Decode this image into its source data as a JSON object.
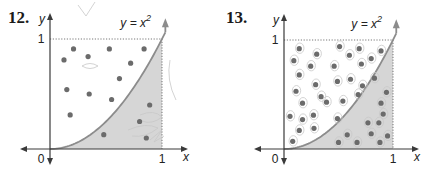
{
  "chart_data": [
    {
      "type": "scatter",
      "problem_number": "12.",
      "curve_label": "y = x",
      "curve_exponent": "2",
      "curve": "y = x^2",
      "xlabel": "x",
      "ylabel": "y",
      "x_ticks": [
        "0",
        "1"
      ],
      "y_ticks": [
        "1"
      ],
      "xlim": [
        0,
        1
      ],
      "ylim": [
        0,
        1
      ],
      "shaded_region": "area under y = x^2 from x = 0 to x = 1",
      "points": [
        [
          0.21,
          0.91
        ],
        [
          0.53,
          0.91
        ],
        [
          0.84,
          0.91
        ],
        [
          0.125,
          0.81
        ],
        [
          0.34,
          0.84
        ],
        [
          0.72,
          0.78
        ],
        [
          0.62,
          0.64
        ],
        [
          0.15,
          0.54
        ],
        [
          0.35,
          0.5
        ],
        [
          0.55,
          0.45
        ],
        [
          0.18,
          0.31
        ],
        [
          0.89,
          0.4
        ],
        [
          0.8,
          0.25
        ],
        [
          0.48,
          0.13
        ],
        [
          0.86,
          0.1
        ]
      ],
      "total_points": 15,
      "points_under_curve": 4
    },
    {
      "type": "scatter",
      "problem_number": "13.",
      "curve_label": "y = x",
      "curve_exponent": "2",
      "curve": "y = x^2",
      "xlabel": "x",
      "ylabel": "y",
      "x_ticks": [
        "0",
        "1"
      ],
      "y_ticks": [
        "1"
      ],
      "xlim": [
        0,
        1
      ],
      "ylim": [
        0,
        1
      ],
      "shaded_region": "area under y = x^2 from x = 0 to x = 1",
      "points": [
        [
          0.14,
          0.92
        ],
        [
          0.3,
          0.87
        ],
        [
          0.09,
          0.81
        ],
        [
          0.245,
          0.76
        ],
        [
          0.14,
          0.68
        ],
        [
          0.29,
          0.59
        ],
        [
          0.11,
          0.53
        ],
        [
          0.34,
          0.48
        ],
        [
          0.39,
          0.43
        ],
        [
          0.17,
          0.42
        ],
        [
          0.27,
          0.31
        ],
        [
          0.055,
          0.3
        ],
        [
          0.17,
          0.27
        ],
        [
          0.14,
          0.17
        ],
        [
          0.275,
          0.19
        ],
        [
          0.08,
          0.07
        ],
        [
          0.51,
          0.94
        ],
        [
          0.69,
          0.92
        ],
        [
          0.89,
          0.9
        ],
        [
          0.6,
          0.86
        ],
        [
          0.8,
          0.83
        ],
        [
          0.46,
          0.76
        ],
        [
          0.71,
          0.78
        ],
        [
          0.49,
          0.62
        ],
        [
          0.61,
          0.64
        ],
        [
          0.83,
          0.65
        ],
        [
          0.72,
          0.58
        ],
        [
          0.54,
          0.44
        ],
        [
          0.68,
          0.5
        ],
        [
          0.49,
          0.28
        ],
        [
          0.94,
          0.52
        ],
        [
          0.89,
          0.42
        ],
        [
          0.91,
          0.32
        ],
        [
          0.77,
          0.24
        ],
        [
          0.87,
          0.24
        ],
        [
          0.58,
          0.13
        ],
        [
          0.8,
          0.14
        ],
        [
          0.95,
          0.12
        ],
        [
          0.5,
          0.06
        ],
        [
          0.67,
          0.06
        ],
        [
          0.88,
          0.06
        ]
      ],
      "total_points": 41,
      "points_under_curve": 11
    }
  ],
  "colors": {
    "axis": "#3a3a3a",
    "curve": "#8c8c8c",
    "shade": "#d6d6d6",
    "dot": "#6b6b6b",
    "dotted_guide": "#555555",
    "pencil": "#c8c8c8"
  }
}
